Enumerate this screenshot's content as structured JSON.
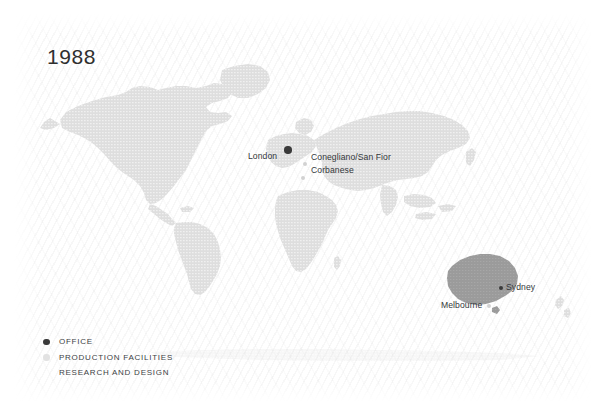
{
  "title": {
    "year": "1988"
  },
  "map": {
    "type": "world-map",
    "highlighted_region": "Australia",
    "colors": {
      "background": "#ffffff",
      "land": "#dcdcdc",
      "land_highlight": "#9a9a9a",
      "office_marker": "#3a3a3a",
      "production_marker": "#d2d2d2",
      "text": "#33373a"
    },
    "locations": [
      {
        "name": "London",
        "marker": "office",
        "label_position": "left",
        "x": 287,
        "y": 150,
        "label_x": 249,
        "label_y": 152
      },
      {
        "name": "Conegliano/San Fior",
        "marker": "production",
        "label_position": "right",
        "x": 305,
        "y": 164,
        "label_x": 312,
        "label_y": 155
      },
      {
        "name": "Corbanese",
        "marker": "production",
        "label_position": "right",
        "x": 303,
        "y": 178,
        "label_x": 312,
        "label_y": 167
      },
      {
        "name": "Sydney",
        "marker": "office",
        "label_position": "right",
        "x": 501,
        "y": 288,
        "label_x": 507,
        "label_y": 283
      },
      {
        "name": "Melbourne",
        "marker": "production",
        "label_position": "left",
        "x": 489,
        "y": 306,
        "label_x": 443,
        "label_y": 301
      }
    ]
  },
  "legend": {
    "items": [
      {
        "label": "OFFICE",
        "type": "office"
      },
      {
        "label": "PRODUCTION FACILITIES",
        "type": "production"
      },
      {
        "label": "RESEARCH AND DESIGN",
        "type": "research"
      }
    ]
  }
}
